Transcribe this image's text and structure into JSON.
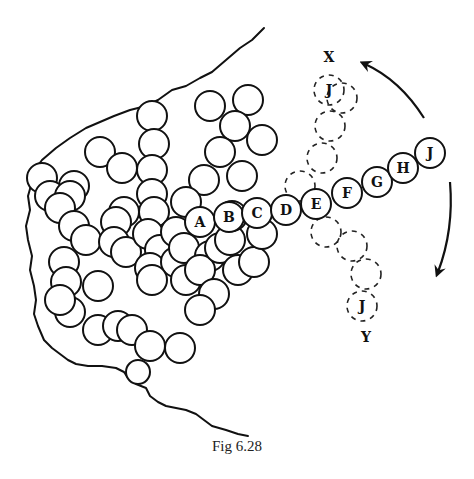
{
  "figure": {
    "caption": "Fig 6.28",
    "chain_labels": [
      "A",
      "B",
      "C",
      "D",
      "E",
      "F",
      "G",
      "H",
      "J"
    ],
    "ghost_top_end_label": "J",
    "ghost_bottom_end_label": "J",
    "direction_top_label": "X",
    "direction_bottom_label": "Y",
    "arrows": [
      "counter-clockwise-arrow",
      "clockwise-arrow"
    ]
  }
}
